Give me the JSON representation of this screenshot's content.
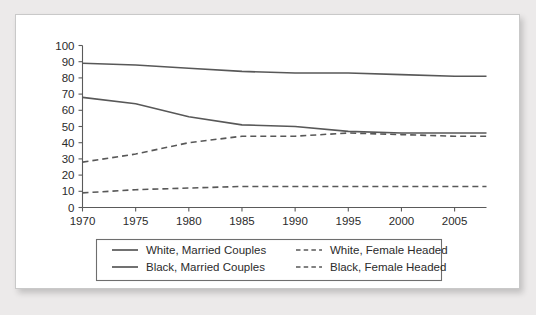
{
  "chart_data": {
    "type": "line",
    "title": "",
    "subtitle": "",
    "xlabel": "",
    "ylabel": "",
    "xlim": [
      1970,
      2008
    ],
    "ylim": [
      0,
      100
    ],
    "grid": false,
    "legend_position": "bottom",
    "x_ticks": [
      1970,
      1975,
      1980,
      1985,
      1990,
      1995,
      2000,
      2005
    ],
    "x_tick_labels": [
      "1970",
      "1975",
      "1980",
      "1985",
      "1990",
      "1995",
      "2000",
      "2005"
    ],
    "y_ticks": [
      0,
      10,
      20,
      30,
      40,
      50,
      60,
      70,
      80,
      90,
      100
    ],
    "y_tick_labels": [
      "0",
      "10",
      "20",
      "30",
      "40",
      "50",
      "60",
      "70",
      "80",
      "90",
      "100"
    ],
    "x": [
      1970,
      1975,
      1980,
      1985,
      1990,
      1995,
      2000,
      2005,
      2008
    ],
    "series": [
      {
        "name": "White, Married Couples",
        "style": "solid",
        "color": "#585858",
        "values": [
          89,
          88,
          86,
          84,
          83,
          83,
          82,
          81,
          81
        ]
      },
      {
        "name": "Black, Married Couples",
        "style": "solid",
        "color": "#585858",
        "values": [
          68,
          64,
          56,
          51,
          50,
          47,
          46,
          46,
          46
        ]
      },
      {
        "name": "White, Female Headed",
        "style": "dashed",
        "color": "#585858",
        "values": [
          9,
          11,
          12,
          13,
          13,
          13,
          13,
          13,
          13
        ]
      },
      {
        "name": "Black, Female Headed",
        "style": "dashed",
        "color": "#585858",
        "values": [
          28,
          33,
          40,
          44,
          44,
          46,
          45,
          44,
          44
        ]
      }
    ],
    "legend": [
      {
        "label": "White, Married Couples",
        "style": "solid"
      },
      {
        "label": "White, Female Headed",
        "style": "dashed"
      },
      {
        "label": "Black, Married Couples",
        "style": "solid"
      },
      {
        "label": "Black, Female Headed",
        "style": "dashed"
      }
    ],
    "colors": {
      "line": "#585858",
      "axis": "#5a5a5a",
      "text": "#2b2b2b",
      "panel_background": "#ffffff",
      "page_background": "#eceaea",
      "panel_border": "#c9c9c9",
      "legend_border": "#6e6e6e"
    }
  }
}
